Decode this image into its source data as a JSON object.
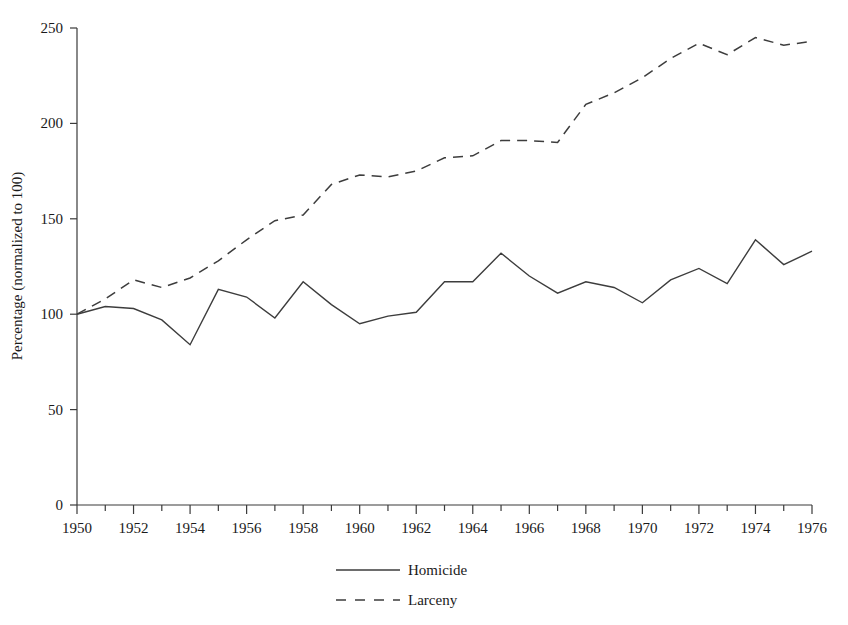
{
  "chart_data": {
    "type": "line",
    "title": "",
    "xlabel": "",
    "ylabel": "Percentage (normalized to 100)",
    "xlim": [
      1950,
      1976
    ],
    "ylim": [
      0,
      250
    ],
    "grid": false,
    "legend_position": "bottom-center",
    "x": [
      1950,
      1951,
      1952,
      1953,
      1954,
      1955,
      1956,
      1957,
      1958,
      1959,
      1960,
      1961,
      1962,
      1963,
      1964,
      1965,
      1966,
      1967,
      1968,
      1969,
      1970,
      1971,
      1972,
      1973,
      1974,
      1975,
      1976
    ],
    "xtick_labels": [
      "1950",
      "1952",
      "1954",
      "1956",
      "1958",
      "1960",
      "1962",
      "1964",
      "1966",
      "1968",
      "1970",
      "1972",
      "1974",
      "1976"
    ],
    "xtick_values": [
      1950,
      1952,
      1954,
      1956,
      1958,
      1960,
      1962,
      1964,
      1966,
      1968,
      1970,
      1972,
      1974,
      1976
    ],
    "ytick_labels": [
      "0",
      "50",
      "100",
      "150",
      "200",
      "250"
    ],
    "ytick_values": [
      0,
      50,
      100,
      150,
      200,
      250
    ],
    "series": [
      {
        "name": "Homicide",
        "style": "solid",
        "color": "#3d3d3d",
        "values": [
          100,
          104,
          103,
          97,
          84,
          113,
          109,
          98,
          117,
          105,
          95,
          99,
          101,
          117,
          117,
          132,
          120,
          111,
          117,
          114,
          106,
          118,
          124,
          116,
          139,
          126,
          133
        ]
      },
      {
        "name": "Larceny",
        "style": "dashed",
        "color": "#3d3d3d",
        "values": [
          100,
          108,
          118,
          114,
          119,
          128,
          139,
          149,
          152,
          168,
          173,
          172,
          175,
          182,
          183,
          191,
          191,
          190,
          210,
          216,
          224,
          234,
          242,
          236,
          245,
          241,
          243
        ]
      }
    ]
  },
  "axis": {
    "y_title": "Percentage (normalized to 100)"
  },
  "legend": {
    "items": [
      {
        "label": "Homicide",
        "style": "solid"
      },
      {
        "label": "Larceny",
        "style": "dashed"
      }
    ]
  }
}
